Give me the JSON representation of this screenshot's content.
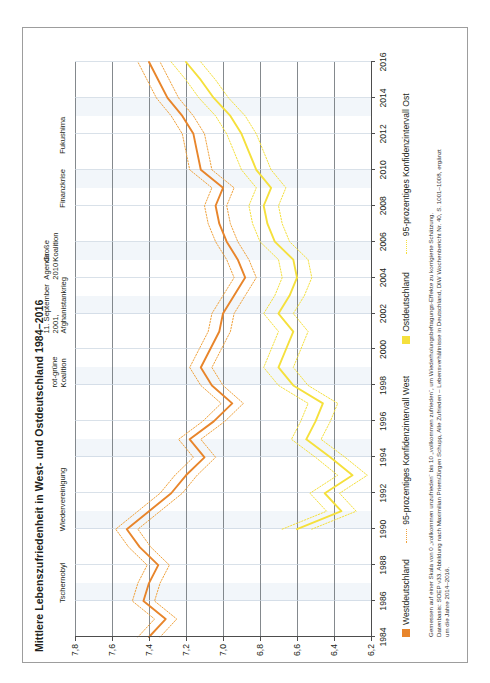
{
  "title": "Mittlere Lebenszufriedenheit in West- und Ostdeutschland 1984–2016",
  "legend": {
    "items": [
      {
        "label": "Westdeutschland",
        "type": "swatch",
        "color": "#E8852B"
      },
      {
        "label": "95-prozentiges Konfidenzintervall West",
        "type": "dotted",
        "color": "#F0A23C"
      },
      {
        "label": "Ostdeutschland",
        "type": "swatch",
        "color": "#F5E03C"
      },
      {
        "label": "95-prozentiges Konfidenzintervall Ost",
        "type": "dotted",
        "color": "#F5E03C"
      }
    ]
  },
  "note": "Gemessen auf einer Skala von 0 „vollkommen unzufrieden“ bis 10 „vollkommen zufrieden“, um Wiederholungsbefragungs-Effekte zu korrigierte Schätzung.\nDatenbasis: SOEP v33. Abbildung nach Maximilian Priem/Jürgen Schupp, Alle Zufrieden – Lebensverhältnisse in Deutschland, DIW Wochenbericht Nr. 40, S. 1001–1008, ergänzt\num die Jahre 2014–2016.",
  "annotations": [
    {
      "id": "tschernobyl",
      "text": "Tschernobyl",
      "year": 1986
    },
    {
      "id": "wiedervereinigung",
      "text": "Wiedervereinigung",
      "year": 1990
    },
    {
      "id": "rot-gruene-koalition",
      "text": "rot-grüne\nKoalition",
      "year": 1998
    },
    {
      "id": "11-september",
      "text": "11. September\n2001,\nAfghanistankrieg",
      "year": 2001
    },
    {
      "id": "agenda-2010",
      "text": "Agenda\n2010",
      "year": 2004
    },
    {
      "id": "grosse-koalition",
      "text": "Große\nKoalition",
      "year": 2005
    },
    {
      "id": "finanzkrise",
      "text": "Finanzkrise",
      "year": 2008
    },
    {
      "id": "fukushima",
      "text": "Fukushima",
      "year": 2011
    }
  ],
  "chart_data": {
    "type": "line",
    "title": "Mittlere Lebenszufriedenheit in West- und Ostdeutschland 1984–2016",
    "xlabel": "",
    "ylabel": "",
    "xlim": [
      1984,
      2016
    ],
    "ylim": [
      6.2,
      7.8
    ],
    "grid": true,
    "legend_position": "below-plot",
    "xticks": [
      1984,
      1986,
      1988,
      1990,
      1992,
      1994,
      1996,
      1998,
      2000,
      2002,
      2004,
      2006,
      2008,
      2010,
      2012,
      2014,
      2016
    ],
    "yticks": [
      "7,8",
      "7,6",
      "7,4",
      "7,2",
      "7,0",
      "6,8",
      "6,6",
      "6,4",
      "6,2"
    ],
    "ytick_values": [
      7.8,
      7.6,
      7.4,
      7.2,
      7.0,
      6.8,
      6.6,
      6.4,
      6.2
    ],
    "x": [
      1984,
      1985,
      1986,
      1987,
      1988,
      1989,
      1990,
      1991,
      1992,
      1993,
      1994,
      1995,
      1996,
      1997,
      1998,
      1999,
      2000,
      2001,
      2002,
      2003,
      2004,
      2005,
      2006,
      2007,
      2008,
      2009,
      2010,
      2011,
      2012,
      2013,
      2014,
      2015,
      2016
    ],
    "series": [
      {
        "name": "Westdeutschland",
        "color": "#E8852B",
        "values": [
          7.4,
          7.31,
          7.43,
          7.4,
          7.35,
          7.45,
          7.52,
          7.4,
          7.28,
          7.2,
          7.1,
          7.18,
          7.05,
          6.95,
          7.06,
          7.12,
          7.07,
          7.02,
          7.0,
          6.94,
          6.88,
          6.92,
          6.98,
          7.02,
          7.04,
          7.0,
          7.12,
          7.14,
          7.16,
          7.22,
          7.3,
          7.35,
          7.4
        ]
      },
      {
        "name": "95-prozentiges Konfidenzintervall West",
        "color": "#F0A23C",
        "upper": [
          7.46,
          7.37,
          7.49,
          7.46,
          7.41,
          7.51,
          7.58,
          7.46,
          7.34,
          7.26,
          7.16,
          7.24,
          7.11,
          7.01,
          7.12,
          7.18,
          7.13,
          7.08,
          7.06,
          7.0,
          6.94,
          6.98,
          7.04,
          7.08,
          7.1,
          7.06,
          7.18,
          7.2,
          7.22,
          7.28,
          7.36,
          7.41,
          7.46
        ],
        "lower": [
          7.34,
          7.25,
          7.37,
          7.34,
          7.29,
          7.39,
          7.46,
          7.34,
          7.22,
          7.14,
          7.04,
          7.12,
          6.99,
          6.89,
          7.0,
          7.06,
          7.01,
          6.96,
          6.94,
          6.88,
          6.82,
          6.86,
          6.92,
          6.96,
          6.98,
          6.94,
          7.06,
          7.08,
          7.1,
          7.16,
          7.24,
          7.29,
          7.34
        ]
      },
      {
        "name": "Ostdeutschland",
        "color": "#F5E03C",
        "values": [
          null,
          null,
          null,
          null,
          null,
          null,
          6.6,
          6.36,
          6.45,
          6.3,
          6.42,
          6.55,
          6.5,
          6.46,
          6.62,
          6.7,
          6.66,
          6.62,
          6.7,
          6.64,
          6.6,
          6.62,
          6.72,
          6.76,
          6.78,
          6.74,
          6.82,
          6.86,
          6.9,
          6.96,
          7.05,
          7.12,
          7.2
        ]
      },
      {
        "name": "95-prozentiges Konfidenzintervall Ost",
        "color": "#F5E03C",
        "upper": [
          null,
          null,
          null,
          null,
          null,
          null,
          6.68,
          6.44,
          6.53,
          6.38,
          6.5,
          6.63,
          6.58,
          6.54,
          6.7,
          6.78,
          6.74,
          6.7,
          6.78,
          6.72,
          6.68,
          6.7,
          6.8,
          6.84,
          6.86,
          6.82,
          6.9,
          6.94,
          6.98,
          7.04,
          7.13,
          7.2,
          7.28
        ],
        "lower": [
          null,
          null,
          null,
          null,
          null,
          null,
          6.52,
          6.28,
          6.37,
          6.22,
          6.34,
          6.47,
          6.42,
          6.38,
          6.54,
          6.62,
          6.58,
          6.54,
          6.62,
          6.56,
          6.52,
          6.54,
          6.64,
          6.68,
          6.7,
          6.66,
          6.74,
          6.78,
          6.82,
          6.88,
          6.97,
          7.04,
          7.12
        ]
      }
    ],
    "bands": [
      {
        "from": 1986,
        "to": 1987
      },
      {
        "from": 1990,
        "to": 1991
      },
      {
        "from": 1994,
        "to": 1995
      },
      {
        "from": 1998,
        "to": 1999
      },
      {
        "from": 2002,
        "to": 2003
      },
      {
        "from": 2005,
        "to": 2006
      },
      {
        "from": 2009,
        "to": 2010
      },
      {
        "from": 2013,
        "to": 2014
      }
    ]
  }
}
